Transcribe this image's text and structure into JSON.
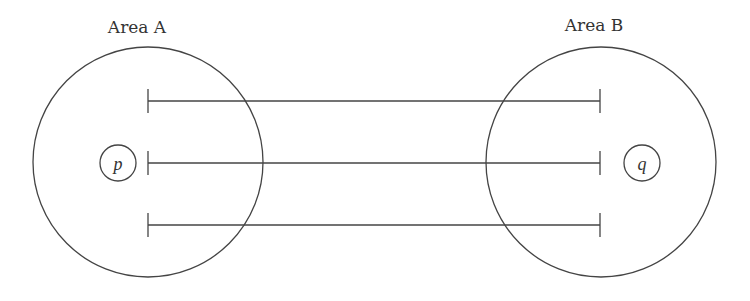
{
  "diagram": {
    "area_a": {
      "label": "Area A",
      "point_label": "p"
    },
    "area_b": {
      "label": "Area B",
      "point_label": "q"
    },
    "connections": [
      {
        "from": "Area A",
        "to": "Area B",
        "row": 1
      },
      {
        "from": "Area A",
        "to": "Area B",
        "row": 2
      },
      {
        "from": "Area A",
        "to": "Area B",
        "row": 3
      }
    ],
    "colors": {
      "stroke": "#444444",
      "text": "#333333",
      "background": "#ffffff"
    }
  }
}
